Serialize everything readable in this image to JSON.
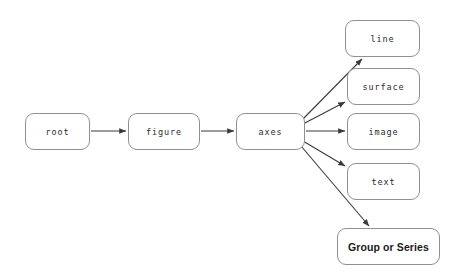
{
  "diagram": {
    "type": "tree",
    "orientation": "left-to-right",
    "background_color": "#ffffff",
    "node_border_color": "#8e9095",
    "node_fill_color": "#ffffff",
    "edge_color": "#3a3a3a",
    "text_color": "#2b2b2b",
    "nodes": [
      {
        "id": "root",
        "label": "root",
        "x": 25,
        "y": 113,
        "width": 65,
        "height": 37,
        "font": "mono"
      },
      {
        "id": "figure",
        "label": "figure",
        "x": 128,
        "y": 113,
        "width": 72,
        "height": 37,
        "font": "mono"
      },
      {
        "id": "axes",
        "label": "axes",
        "x": 236,
        "y": 113,
        "width": 69,
        "height": 37,
        "font": "mono"
      },
      {
        "id": "line",
        "label": "line",
        "x": 345,
        "y": 20,
        "width": 75,
        "height": 37,
        "font": "mono"
      },
      {
        "id": "surface",
        "label": "surface",
        "x": 347,
        "y": 68,
        "width": 73,
        "height": 37,
        "font": "mono"
      },
      {
        "id": "image",
        "label": "image",
        "x": 347,
        "y": 113,
        "width": 73,
        "height": 37,
        "font": "mono"
      },
      {
        "id": "text",
        "label": "text",
        "x": 347,
        "y": 163,
        "width": 73,
        "height": 37,
        "font": "mono"
      },
      {
        "id": "group-or-series",
        "label": "Group or Series",
        "x": 337,
        "y": 228,
        "width": 103,
        "height": 37,
        "font": "sans-bold"
      }
    ],
    "edges": [
      {
        "id": "root-figure",
        "from": "root",
        "to": "figure",
        "x1": 91,
        "y1": 131,
        "x2": 126,
        "y2": 131
      },
      {
        "id": "figure-axes",
        "from": "figure",
        "to": "axes",
        "x1": 201,
        "y1": 131,
        "x2": 234,
        "y2": 131
      },
      {
        "id": "axes-line",
        "from": "axes",
        "to": "line",
        "x1": 300,
        "y1": 122,
        "x2": 362,
        "y2": 59
      },
      {
        "id": "axes-surface",
        "from": "axes",
        "to": "surface",
        "x1": 303,
        "y1": 124,
        "x2": 345,
        "y2": 102
      },
      {
        "id": "axes-image",
        "from": "axes",
        "to": "image",
        "x1": 306,
        "y1": 131,
        "x2": 345,
        "y2": 131
      },
      {
        "id": "axes-text",
        "from": "axes",
        "to": "text",
        "x1": 303,
        "y1": 141,
        "x2": 345,
        "y2": 166
      },
      {
        "id": "axes-group",
        "from": "axes",
        "to": "group-or-series",
        "x1": 301,
        "y1": 146,
        "x2": 369,
        "y2": 226
      }
    ]
  }
}
